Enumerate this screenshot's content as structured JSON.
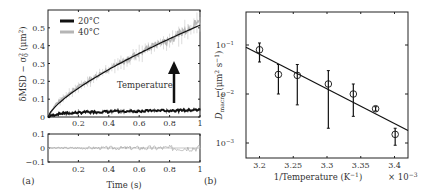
{
  "chart_data": [
    {
      "panel": "(a)",
      "type": "line",
      "title": "",
      "xlabel": "Time (s)",
      "ylabel": "δMSD − σ0² (μm²)",
      "xlim": [
        0,
        1
      ],
      "ylim": [
        0,
        0.6
      ],
      "xticks": [
        "0.2",
        "0.4",
        "0.6",
        "0.8",
        "1"
      ],
      "yticks": [
        "0",
        "0.1",
        "0.2",
        "0.3",
        "0.4",
        "0.5"
      ],
      "legend": [
        "20°C",
        "40°C"
      ],
      "legend_position": "upper left",
      "annotation": "Temperature",
      "series": [
        {
          "name": "20°C",
          "color": "#111111",
          "x": [
            0,
            0.05,
            0.1,
            0.2,
            0.3,
            0.4,
            0.5,
            0.6,
            0.7,
            0.8,
            0.9,
            1.0
          ],
          "values": [
            0,
            0.015,
            0.02,
            0.025,
            0.028,
            0.03,
            0.032,
            0.033,
            0.035,
            0.036,
            0.038,
            0.04
          ]
        },
        {
          "name": "40°C",
          "color": "#b0b0b0",
          "x": [
            0,
            0.05,
            0.1,
            0.2,
            0.3,
            0.4,
            0.5,
            0.6,
            0.7,
            0.8,
            0.9,
            1.0
          ],
          "values": [
            0,
            0.07,
            0.11,
            0.17,
            0.22,
            0.27,
            0.31,
            0.36,
            0.4,
            0.43,
            0.49,
            0.54
          ]
        },
        {
          "name": "fit 40°C",
          "color": "#111111",
          "x": [
            0,
            0.05,
            0.1,
            0.2,
            0.3,
            0.4,
            0.5,
            0.6,
            0.7,
            0.8,
            0.9,
            1.0
          ],
          "values": [
            0,
            0.065,
            0.1,
            0.16,
            0.215,
            0.265,
            0.31,
            0.355,
            0.395,
            0.435,
            0.475,
            0.515
          ]
        }
      ]
    },
    {
      "panel": "(a) residuals",
      "type": "line",
      "xlabel": "Time (s)",
      "ylabel": "",
      "xlim": [
        0,
        1
      ],
      "ylim": [
        -0.1,
        0.1
      ],
      "xticks": [
        "0.2",
        "0.4",
        "0.6",
        "0.8",
        "1"
      ],
      "yticks": [
        "0.1",
        "0",
        "−0.1"
      ],
      "series": [
        {
          "name": "residual",
          "color": "#bbbbbb",
          "x": [
            0,
            0.2,
            0.4,
            0.5,
            0.6,
            0.7,
            0.8,
            0.85,
            0.9,
            1.0
          ],
          "values": [
            0,
            0.0,
            0.005,
            -0.005,
            -0.015,
            -0.01,
            0.005,
            -0.02,
            0.005,
            0.0
          ]
        }
      ]
    },
    {
      "panel": "(b)",
      "type": "scatter",
      "xlabel": "1/Temperature (K⁻¹)",
      "x_multiplier": "× 10⁻³",
      "ylabel": "D_macro (μm² s⁻¹)",
      "yscale": "log",
      "xlim": [
        3.18,
        3.42
      ],
      "ylim": [
        0.0005,
        0.6
      ],
      "xticks": [
        "3.2",
        "3.25",
        "3.3",
        "3.35",
        "3.4"
      ],
      "yticks": [
        "10⁻¹",
        "10⁻²",
        "10⁻³"
      ],
      "series": [
        {
          "name": "data",
          "marker": "circle",
          "x": [
            3.2,
            3.228,
            3.256,
            3.302,
            3.339,
            3.372,
            3.401
          ],
          "values": [
            0.08,
            0.025,
            0.024,
            0.016,
            0.01,
            0.005,
            0.0015
          ],
          "err_low": [
            0.045,
            0.01,
            0.006,
            0.002,
            0.0035,
            0.0045,
            0.0009
          ],
          "err_high": [
            0.11,
            0.04,
            0.04,
            0.03,
            0.016,
            0.0055,
            0.002
          ]
        },
        {
          "name": "fit",
          "type": "line",
          "x": [
            3.18,
            3.42
          ],
          "values": [
            0.09,
            0.0018
          ]
        }
      ]
    }
  ],
  "labels": {
    "panel_a": "(a)",
    "panel_b": "(b)",
    "a_xlabel": "Time (s)",
    "a_annotation": "Temperature",
    "a_legend_1": "20°C",
    "a_legend_2": "40°C",
    "b_xlabel": "1/Temperature (K",
    "b_mult": "× 10",
    "b_ylabel_main": "D",
    "b_ylabel_sub": "macro",
    "b_ylabel_unit": " (μm² s⁻¹)"
  }
}
